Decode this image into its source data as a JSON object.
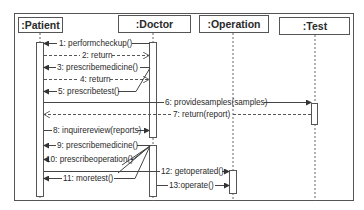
{
  "diagram": {
    "type": "sequence",
    "colors": {
      "line": "#4a4a4a",
      "text": "#2a2a2a",
      "background": "#ffffff"
    },
    "lifelines": [
      {
        "id": "patient",
        "label": ":Patient",
        "x": 40
      },
      {
        "id": "doctor",
        "label": ":Doctor",
        "x": 153
      },
      {
        "id": "operation",
        "label": ":Operation",
        "x": 233
      },
      {
        "id": "test",
        "label": ":Test",
        "x": 315
      }
    ],
    "messages": [
      {
        "n": 1,
        "label": "1: performcheckup()",
        "from": "doctor",
        "to": "patient",
        "style": "sync"
      },
      {
        "n": 2,
        "label": "2: return",
        "from": "patient",
        "to": "doctor",
        "style": "return"
      },
      {
        "n": 3,
        "label": "3: prescribemedicine()",
        "from": "doctor",
        "to": "patient",
        "style": "sync"
      },
      {
        "n": 4,
        "label": "4: return",
        "from": "patient",
        "to": "doctor",
        "style": "return"
      },
      {
        "n": 5,
        "label": "5: prescribetest()",
        "from": "doctor",
        "to": "patient",
        "style": "sync"
      },
      {
        "n": 6,
        "label": "6: providesamples(samples)",
        "from": "patient",
        "to": "test",
        "style": "sync"
      },
      {
        "n": 7,
        "label": "7: return(report)",
        "from": "test",
        "to": "patient",
        "style": "return"
      },
      {
        "n": 8,
        "label": "8: inquirereview(reports)",
        "from": "patient",
        "to": "doctor",
        "style": "sync"
      },
      {
        "n": 9,
        "label": "9: prescribemedicine()",
        "from": "doctor",
        "to": "patient",
        "style": "sync"
      },
      {
        "n": 10,
        "label": "10: prescribeoperation()",
        "from": "doctor",
        "to": "patient",
        "style": "sync"
      },
      {
        "n": 11,
        "label": "11: moretest()",
        "from": "doctor",
        "to": "patient",
        "style": "sync"
      },
      {
        "n": 12,
        "label": "12: getoperated()",
        "from": "patient",
        "to": "operation",
        "style": "sync"
      },
      {
        "n": 13,
        "label": "13:operate()",
        "from": "doctor",
        "to": "operation",
        "style": "sync"
      }
    ]
  }
}
